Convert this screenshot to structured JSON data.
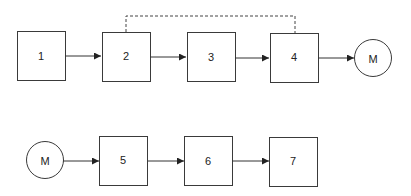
{
  "diagram": {
    "type": "block-flow",
    "top_row": {
      "nodes": [
        {
          "id": "n1",
          "label": "1",
          "shape": "box"
        },
        {
          "id": "n2",
          "label": "2",
          "shape": "box"
        },
        {
          "id": "n3",
          "label": "3",
          "shape": "box"
        },
        {
          "id": "n4",
          "label": "4",
          "shape": "box"
        },
        {
          "id": "m_top",
          "label": "M",
          "shape": "circle"
        }
      ],
      "edges": [
        {
          "from": "1",
          "to": "2",
          "style": "solid-arrow"
        },
        {
          "from": "2",
          "to": "3",
          "style": "solid-arrow"
        },
        {
          "from": "3",
          "to": "4",
          "style": "solid-arrow"
        },
        {
          "from": "4",
          "to": "M",
          "style": "solid-arrow"
        },
        {
          "from": "2",
          "to": "4",
          "style": "dashed-connector"
        }
      ]
    },
    "bottom_row": {
      "nodes": [
        {
          "id": "m_bottom",
          "label": "M",
          "shape": "circle"
        },
        {
          "id": "n5",
          "label": "5",
          "shape": "box"
        },
        {
          "id": "n6",
          "label": "6",
          "shape": "box"
        },
        {
          "id": "n7",
          "label": "7",
          "shape": "box"
        }
      ],
      "edges": [
        {
          "from": "M",
          "to": "5",
          "style": "solid-arrow"
        },
        {
          "from": "5",
          "to": "6",
          "style": "solid-arrow"
        },
        {
          "from": "6",
          "to": "7",
          "style": "solid-arrow"
        }
      ]
    }
  }
}
